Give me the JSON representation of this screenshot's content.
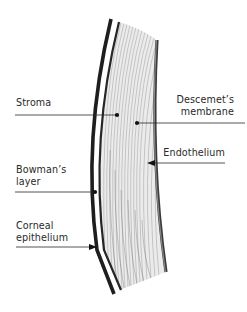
{
  "figure": {
    "labels": {
      "stroma": "Stroma",
      "descemets_membrane": [
        "Descemet’s",
        "membrane"
      ],
      "endothelium": "Endothelium",
      "bowmans_layer": [
        "Bowman’s",
        "layer"
      ],
      "corneal_epithelium": [
        "Corneal",
        "epithelium"
      ]
    },
    "pointer_styles": {
      "stroma": "dot",
      "descemets_membrane": "dot",
      "endothelium": "arrow",
      "bowmans_layer": "dot",
      "corneal_epithelium": "arrow"
    },
    "colors": {
      "ink": "#222222",
      "descemet_band": "#555555",
      "stroma_fill": "#e8e8e8",
      "stroma_fiber": "#9a9a9a",
      "background": "#ffffff"
    },
    "caption_cropped": "· · ·"
  }
}
